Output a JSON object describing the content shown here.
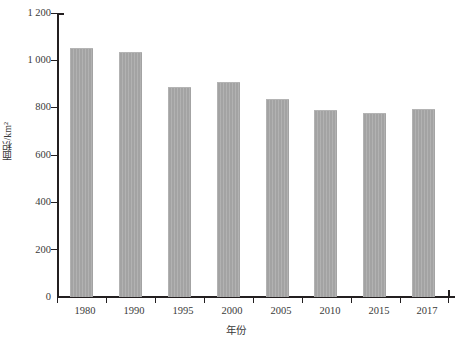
{
  "chart_data": {
    "type": "bar",
    "title": "",
    "subtitle": "",
    "xlabel": "年份",
    "ylabel": "面积/km²",
    "categories": [
      "1980",
      "1990",
      "1995",
      "2000",
      "2005",
      "2010",
      "2015",
      "2017"
    ],
    "values": [
      1050,
      1035,
      885,
      908,
      835,
      790,
      775,
      793
    ],
    "series": [
      {
        "name": "面积",
        "values": [
          1050,
          1035,
          885,
          908,
          835,
          790,
          775,
          793
        ]
      }
    ],
    "ylim": [
      0,
      1200
    ],
    "ytick_values": [
      0,
      200,
      400,
      600,
      800,
      1000,
      1200
    ],
    "ytick_labels": [
      "0",
      "200",
      "400",
      "600",
      "800",
      "1 000",
      "1 200"
    ],
    "grid": false,
    "legend": false,
    "legend_position": "none",
    "bar_color": "#a3a3a3",
    "axis_color": "#231f20",
    "text_color": "#3a3a3a",
    "annotations": []
  }
}
